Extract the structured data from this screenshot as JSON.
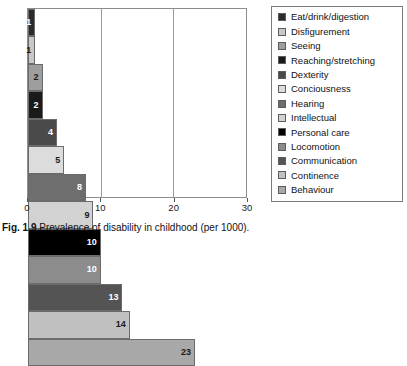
{
  "caption": {
    "figure_number": "Fig. 1.9",
    "text": "Prevalence of disability in childhood (per 1000)."
  },
  "chart_data": {
    "type": "bar",
    "orientation": "horizontal",
    "title": "Prevalence of disability in childhood (per 1000)",
    "xlabel": "",
    "ylabel": "",
    "xlim": [
      0,
      30
    ],
    "xticks": [
      "0",
      "10",
      "20",
      "30"
    ],
    "xtick_values": [
      0,
      10,
      20,
      30
    ],
    "grid": true,
    "grid_axis": "x",
    "legend_position": "right",
    "categories": [
      "Eat/drink/digestion",
      "Disfigurement",
      "Seeing",
      "Reaching/stretching",
      "Dexterity",
      "Conciousness",
      "Hearing",
      "Intellectual",
      "Personal care",
      "Locomotion",
      "Communication",
      "Continence",
      "Behaviour"
    ],
    "values": [
      1,
      1,
      2,
      2,
      4,
      5,
      8,
      9,
      10,
      10,
      13,
      14,
      23
    ],
    "colors": [
      "#2b2b2b",
      "#c8c8c8",
      "#9e9e9e",
      "#1a1a1a",
      "#4a4a4a",
      "#dcdcdc",
      "#6e6e6e",
      "#d2d2d2",
      "#000000",
      "#8c8c8c",
      "#545454",
      "#c0c0c0",
      "#a8a8a8"
    ],
    "label_colors": [
      "#ffffff",
      "#1a1a1a",
      "#1a1a1a",
      "#ffffff",
      "#ffffff",
      "#1a1a1a",
      "#ffffff",
      "#1a1a1a",
      "#ffffff",
      "#ffffff",
      "#ffffff",
      "#1a1a1a",
      "#1a1a1a"
    ]
  }
}
